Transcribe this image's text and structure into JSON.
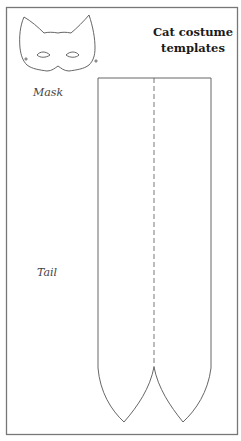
{
  "title": {
    "line1": "Cat costume",
    "line2": "templates"
  },
  "labels": {
    "mask": "Mask",
    "tail": "Tail"
  },
  "colors": {
    "outline": "#555555",
    "frame": "#777777",
    "text": "#1a1a1a"
  },
  "templates": [
    {
      "name": "mask",
      "shape": "cat-mask-outline"
    },
    {
      "name": "tail",
      "shape": "two-pointed-strip-with-dashed-fold"
    }
  ]
}
